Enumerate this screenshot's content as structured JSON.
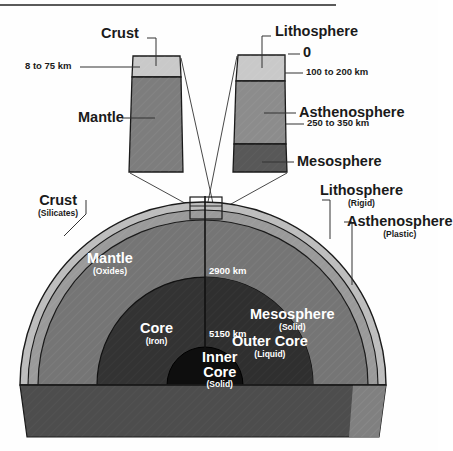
{
  "figure": {
    "top_rule": "horizontal-rule"
  },
  "callouts": {
    "left_column": {
      "name": "compositional-column",
      "layers": [
        {
          "id": "crust",
          "label": "Crust",
          "fill": "#c9c9c9"
        },
        {
          "id": "mantle",
          "label": "Mantle",
          "fill": "#7d7d7d"
        }
      ],
      "depth_labels": [
        {
          "id": "crust-thickness",
          "text": "8 to 75 km"
        }
      ]
    },
    "right_column": {
      "name": "mechanical-column",
      "layers": [
        {
          "id": "lithosphere",
          "label": "Lithosphere",
          "fill": "#c9c9c9"
        },
        {
          "id": "asthenosphere",
          "label": "Asthenosphere",
          "fill": "#8c8c8c"
        },
        {
          "id": "mesosphere",
          "label": "Mesosphere",
          "fill": "#585858"
        }
      ],
      "depth_labels": [
        {
          "id": "surface",
          "text": "0"
        },
        {
          "id": "lithosphere-base",
          "text": "100 to 200 km"
        },
        {
          "id": "asthenosphere-base",
          "text": "250 to 350 km"
        }
      ]
    }
  },
  "earth": {
    "exterior_labels": [
      {
        "id": "crust",
        "main": "Crust",
        "sub": "(Silicates)"
      },
      {
        "id": "lithosphere",
        "main": "Lithosphere",
        "sub": "(Rigid)"
      },
      {
        "id": "asthenosphere",
        "main": "Asthenosphere",
        "sub": "(Plastic)"
      }
    ],
    "interior_labels": [
      {
        "id": "mantle",
        "main": "Mantle",
        "sub": "(Oxides)"
      },
      {
        "id": "mesosphere",
        "main": "Mesosphere",
        "sub": "(Solid)"
      },
      {
        "id": "core",
        "main": "Core",
        "sub": "(Iron)"
      },
      {
        "id": "outer-core",
        "main": "Outer Core",
        "sub": "(Liquid)"
      },
      {
        "id": "inner-core",
        "main": "Inner\nCore",
        "main_line1": "Inner",
        "main_line2": "Core",
        "sub": "(Solid)"
      }
    ],
    "depth_labels": [
      {
        "id": "mantle-core-boundary",
        "text": "2900 km"
      },
      {
        "id": "outer-inner-core-boundary",
        "text": "5150 km"
      }
    ]
  },
  "colors": {
    "crust": "#c9c9c9",
    "lithosphere_ring": "#bdbdbd",
    "asthenosphere_ring": "#9a9a9a",
    "mantle": "#757575",
    "mesosphere": "#6e6e6e",
    "core": "#3a3a3a",
    "outer_core": "#2e2e2e",
    "inner_core": "#111111",
    "slab_left": "#4a4a4a",
    "slab_right": "#8a8a8a",
    "outline": "#1a1a1a",
    "leader": "#333333",
    "text": "#1a1a1a",
    "text_on_dark": "#ffffff",
    "background": "#fefefe"
  }
}
